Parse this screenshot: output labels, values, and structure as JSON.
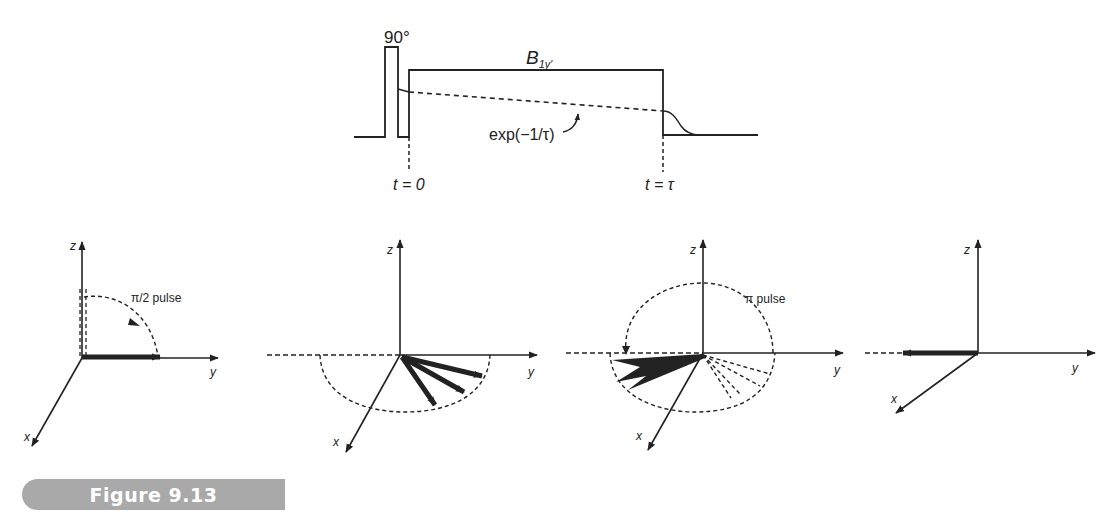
{
  "figure": {
    "caption": "Figure 9.13",
    "caption_color": "#a9a9a9",
    "ink_color": "#222222"
  },
  "pulse_sequence": {
    "pulse_label": "90°",
    "field_label_main": "B",
    "field_label_sub": "1y′",
    "decay_label": "exp(−1/τ)",
    "time_start_label": "t = 0",
    "time_end_label": "t = τ"
  },
  "vector_diagrams": [
    {
      "id": "panel-1",
      "axis_labels": {
        "z": "z",
        "y": "y",
        "x": "x"
      },
      "annotation": "π/2 pulse"
    },
    {
      "id": "panel-2",
      "axis_labels": {
        "z": "z",
        "y": "y",
        "x": "x"
      },
      "annotation": ""
    },
    {
      "id": "panel-3",
      "axis_labels": {
        "z": "z",
        "y": "y",
        "x": "x"
      },
      "annotation": "π pulse"
    },
    {
      "id": "panel-4",
      "axis_labels": {
        "z": "z",
        "y": "y",
        "x": "x"
      },
      "annotation": ""
    }
  ]
}
